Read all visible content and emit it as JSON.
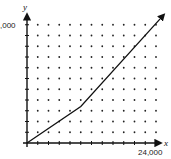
{
  "chart_data": {
    "type": "line",
    "title": "",
    "xlabel": "x",
    "ylabel": "y",
    "x_tick_step": 2000,
    "y_tick_step": 2000,
    "x_ticks_count": 12,
    "y_ticks_count": 11,
    "xlim": [
      0,
      25400
    ],
    "ylim": [
      0,
      23800
    ],
    "x_labels": [
      {
        "value": 24000,
        "text": "24,000"
      }
    ],
    "y_labels": [
      {
        "value": 20000,
        "text": ",000"
      }
    ],
    "grid": "dots",
    "series": [
      {
        "name": "line",
        "points": [
          [
            0,
            0
          ],
          [
            10000,
            6800
          ],
          [
            25400,
            23800
          ]
        ],
        "end_arrow": true
      }
    ],
    "colors": {
      "line": "#111111",
      "axis": "#111111",
      "dots": "#222222"
    }
  },
  "labels": {
    "x_axis_name": "x",
    "y_axis_name": "y",
    "x_end_label": "24,000",
    "y_top_label": ",000"
  }
}
